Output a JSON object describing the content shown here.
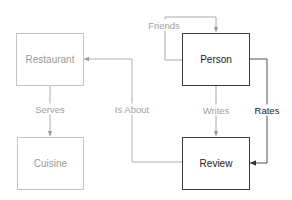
{
  "nodes": {
    "restaurant": {
      "label": "Restaurant"
    },
    "cuisine": {
      "label": "Cuisine"
    },
    "person": {
      "label": "Person"
    },
    "review": {
      "label": "Review"
    }
  },
  "edges": {
    "friends": {
      "label": "Friends",
      "from": "Person",
      "to": "Person"
    },
    "serves": {
      "label": "Serves",
      "from": "Restaurant",
      "to": "Cuisine"
    },
    "is_about": {
      "label": "Is About",
      "from": "Review",
      "to": "Restaurant"
    },
    "writes": {
      "label": "Writes",
      "from": "Person",
      "to": "Review"
    },
    "rates": {
      "label": "Rates",
      "from": "Person",
      "to": "Review"
    }
  },
  "colors": {
    "muted_border": "#c4c4c4",
    "muted_text": "#9a9a9a",
    "strong_border": "#3a3a3a",
    "strong_text": "#222222",
    "edge_muted": "#a0a0a0",
    "edge_strong": "#444444"
  }
}
